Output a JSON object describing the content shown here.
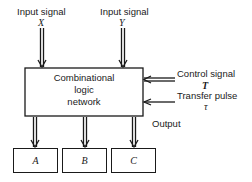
{
  "diagram": {
    "inputs": [
      {
        "label": "Input signal",
        "variable": "X"
      },
      {
        "label": "Input signal",
        "variable": "Y"
      }
    ],
    "main_block": {
      "line1": "Combinational",
      "line2": "logic",
      "line3": "network"
    },
    "control": {
      "label": "Control signal",
      "variable": "T"
    },
    "transfer": {
      "label": "Transfer pulse",
      "variable": "τ"
    },
    "output_label": "Output",
    "registers": [
      {
        "label": "A"
      },
      {
        "label": "B"
      },
      {
        "label": "C"
      }
    ],
    "colors": {
      "line": "#1a1a1a",
      "background": "#ffffff"
    }
  }
}
